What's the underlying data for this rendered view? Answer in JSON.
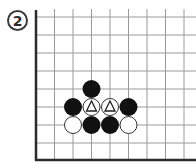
{
  "diagram": {
    "label": "2",
    "board": {
      "grid_color": "#9a9a9a",
      "edge_color": "#2b2b2b",
      "black_color": "#111111",
      "white_fill": "#ffffff",
      "white_stroke": "#333333",
      "visible_edges": [
        "left",
        "bottom"
      ],
      "columns_visible": 9,
      "rows_visible": 9
    },
    "stones": [
      {
        "color": "black",
        "col": 3,
        "row": 4,
        "marker": null
      },
      {
        "color": "black",
        "col": 2,
        "row": 5,
        "marker": null
      },
      {
        "color": "white",
        "col": 3,
        "row": 5,
        "marker": "triangle"
      },
      {
        "color": "white",
        "col": 4,
        "row": 5,
        "marker": "triangle"
      },
      {
        "color": "black",
        "col": 5,
        "row": 5,
        "marker": null
      },
      {
        "color": "white",
        "col": 2,
        "row": 6,
        "marker": null
      },
      {
        "color": "black",
        "col": 3,
        "row": 6,
        "marker": null
      },
      {
        "color": "black",
        "col": 4,
        "row": 6,
        "marker": null
      },
      {
        "color": "white",
        "col": 5,
        "row": 6,
        "marker": null
      }
    ]
  }
}
